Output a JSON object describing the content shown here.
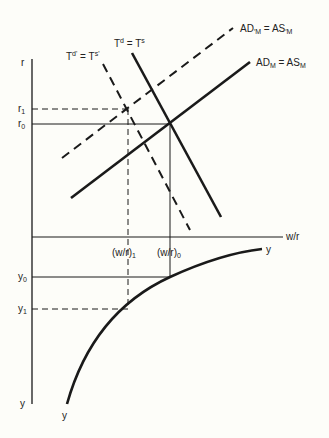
{
  "diagram": {
    "axes": {
      "upper_vertical_label": "r",
      "horizontal_label": "w/r",
      "lower_vertical_label": "y",
      "lower_curve_bottom_label": "y",
      "lower_curve_end_label": "y"
    },
    "ticks": {
      "r1": {
        "base": "r",
        "sub": "1"
      },
      "r0": {
        "base": "r",
        "sub": "0"
      },
      "wr1": {
        "base": "(w/r)",
        "sub": "1"
      },
      "wr0": {
        "base": "(w/r)",
        "sub": "0"
      },
      "y0": {
        "base": "y",
        "sub": "0"
      },
      "y1": {
        "base": "y",
        "sub": "1"
      }
    },
    "curves": {
      "ad_shifted": {
        "text": "AD'M = AS'M",
        "l1": "AD",
        "s1": "M",
        "mid": " = ",
        "l2": "AS",
        "s2": "M",
        "style": "dashed"
      },
      "ad": {
        "text": "ADM = ASM",
        "l1": "AD",
        "s1": "M",
        "mid": " = ",
        "l2": "AS",
        "s2": "M",
        "style": "solid"
      },
      "t": {
        "text": "Td = Ts",
        "l1": "T",
        "s1": "d",
        "mid": " = ",
        "l2": "T",
        "s2": "s",
        "style": "solid"
      },
      "t_shifted": {
        "text": "Td' = Ts'",
        "l1": "T",
        "s1": "d'",
        "mid": " = ",
        "l2": "T",
        "s2": "s'",
        "style": "dashed"
      },
      "production": {
        "text": "y",
        "style": "solid"
      }
    },
    "colors": {
      "line": "#1a1a1a",
      "background": "#fdfdf9"
    }
  }
}
